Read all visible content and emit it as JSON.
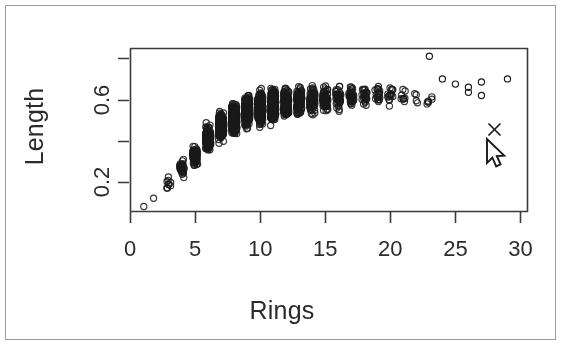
{
  "figure": {
    "kind": "r-scatterplot-screenshot",
    "background_color": "#ffffff",
    "frame_color": "#9a9a9a",
    "axis_color": "#3a3a3a",
    "point_color": "#1a1a1a",
    "cursor_color": "#1a1a1a"
  },
  "chart_data": {
    "type": "scatter",
    "title": "",
    "xlabel": "Rings",
    "ylabel": "Length",
    "xlim": [
      0,
      30.5
    ],
    "ylim": [
      0.06,
      0.85
    ],
    "grid": false,
    "legend": null,
    "x_ticks": [
      0,
      5,
      10,
      15,
      20,
      25,
      30
    ],
    "x_tick_labels": [
      "0",
      "5",
      "10",
      "15",
      "20",
      "25",
      "30"
    ],
    "y_ticks": [
      0.2,
      0.4,
      0.6,
      0.8
    ],
    "y_tick_labels": [
      "0.2",
      "",
      "0.6",
      ""
    ],
    "point_marker": "open-circle",
    "point_radius_px": 3.1,
    "n_points": 4177,
    "series": [
      {
        "name": "abalone",
        "note": "Rings vs Length, heavily overplotted open circles",
        "bins": [
          {
            "rings": 1,
            "count": 1,
            "length_min": 0.075,
            "length_max": 0.09,
            "length_mid": 0.082
          },
          {
            "rings": 2,
            "count": 1,
            "length_min": 0.115,
            "length_max": 0.13,
            "length_mid": 0.122
          },
          {
            "rings": 3,
            "count": 15,
            "length_min": 0.11,
            "length_max": 0.335,
            "length_mid": 0.2
          },
          {
            "rings": 4,
            "count": 57,
            "length_min": 0.13,
            "length_max": 0.43,
            "length_mid": 0.265
          },
          {
            "rings": 5,
            "count": 115,
            "length_min": 0.16,
            "length_max": 0.51,
            "length_mid": 0.33
          },
          {
            "rings": 6,
            "count": 259,
            "length_min": 0.2,
            "length_max": 0.665,
            "length_mid": 0.41
          },
          {
            "rings": 7,
            "count": 391,
            "length_min": 0.215,
            "length_max": 0.705,
            "length_mid": 0.47
          },
          {
            "rings": 8,
            "count": 568,
            "length_min": 0.225,
            "length_max": 0.73,
            "length_mid": 0.51
          },
          {
            "rings": 9,
            "count": 689,
            "length_min": 0.255,
            "length_max": 0.74,
            "length_mid": 0.54
          },
          {
            "rings": 10,
            "count": 634,
            "length_min": 0.27,
            "length_max": 0.755,
            "length_mid": 0.56
          },
          {
            "rings": 11,
            "count": 487,
            "length_min": 0.29,
            "length_max": 0.775,
            "length_mid": 0.575
          },
          {
            "rings": 12,
            "count": 267,
            "length_min": 0.31,
            "length_max": 0.77,
            "length_mid": 0.58
          },
          {
            "rings": 13,
            "count": 203,
            "length_min": 0.32,
            "length_max": 0.78,
            "length_mid": 0.59
          },
          {
            "rings": 14,
            "count": 126,
            "length_min": 0.33,
            "length_max": 0.815,
            "length_mid": 0.595
          },
          {
            "rings": 15,
            "count": 103,
            "length_min": 0.345,
            "length_max": 0.78,
            "length_mid": 0.6
          },
          {
            "rings": 16,
            "count": 67,
            "length_min": 0.375,
            "length_max": 0.77,
            "length_mid": 0.61
          },
          {
            "rings": 17,
            "count": 58,
            "length_min": 0.4,
            "length_max": 0.775,
            "length_mid": 0.615
          },
          {
            "rings": 18,
            "count": 42,
            "length_min": 0.43,
            "length_max": 0.76,
            "length_mid": 0.62
          },
          {
            "rings": 19,
            "count": 32,
            "length_min": 0.455,
            "length_max": 0.755,
            "length_mid": 0.625
          },
          {
            "rings": 20,
            "count": 26,
            "length_min": 0.46,
            "length_max": 0.745,
            "length_mid": 0.62
          },
          {
            "rings": 21,
            "count": 14,
            "length_min": 0.47,
            "length_max": 0.72,
            "length_mid": 0.615
          },
          {
            "rings": 22,
            "count": 6,
            "length_min": 0.505,
            "length_max": 0.7,
            "length_mid": 0.61
          },
          {
            "rings": 23,
            "count": 9,
            "length_min": 0.44,
            "length_max": 0.69,
            "length_mid": 0.595
          }
        ],
        "tail_points": [
          {
            "rings": 23,
            "length": 0.81
          },
          {
            "rings": 24,
            "length": 0.7
          },
          {
            "rings": 25,
            "length": 0.675
          },
          {
            "rings": 26,
            "length": 0.66
          },
          {
            "rings": 26,
            "length": 0.635
          },
          {
            "rings": 27,
            "length": 0.62
          },
          {
            "rings": 27,
            "length": 0.685
          },
          {
            "rings": 29,
            "length": 0.7
          }
        ]
      }
    ],
    "annotations": [
      {
        "name": "cross-marker",
        "symbol": "x",
        "rings": 28.0,
        "length": 0.455
      }
    ]
  },
  "pointer": {
    "name": "mouse-cursor",
    "shape": "arrow",
    "x_px": 487,
    "y_px": 139
  },
  "geometry": {
    "plot_left_px": 130,
    "plot_right_px": 527,
    "plot_top_px": 48,
    "plot_bottom_px": 211
  }
}
